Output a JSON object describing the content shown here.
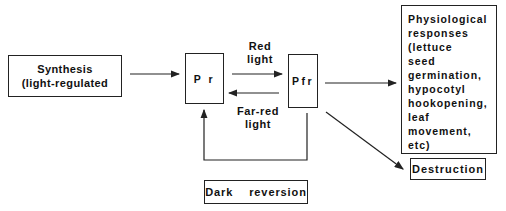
{
  "diagram": {
    "type": "phytochrome interconversion flowchart",
    "nodes": {
      "synthesis": {
        "lines": [
          "Synthesis",
          "(light-regulated"
        ]
      },
      "pr": {
        "label": "P r"
      },
      "pfr": {
        "label": "Pfr"
      },
      "physiological": {
        "lines": [
          "Physiological",
          "responses",
          "(lettuce",
          "seed",
          "germination,",
          "hypocotyl",
          "hookopening,",
          "leaf",
          "movement,",
          "etc)"
        ]
      },
      "destruction": {
        "label": "Destruction"
      },
      "dark_reversion": {
        "label": "Dark  reversion"
      }
    },
    "edges": {
      "red_light": {
        "lines": [
          "Red",
          "light"
        ]
      },
      "far_red_light": {
        "lines": [
          "Far-red",
          "light"
        ]
      }
    },
    "colors": {
      "line": "#222222",
      "background": "#ffffff"
    }
  }
}
